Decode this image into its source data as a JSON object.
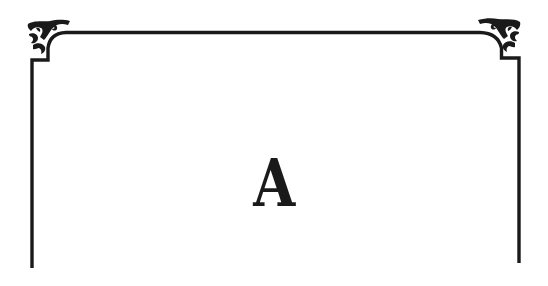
{
  "card": {
    "letter": "A",
    "frame_color": "#1a1a1a",
    "background": "#ffffff",
    "ornament": "scroll-corner-flourish"
  }
}
